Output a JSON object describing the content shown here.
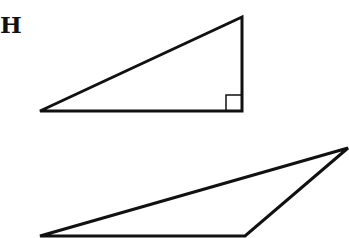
{
  "diagram": {
    "label": "H",
    "stroke_color": "#111111",
    "shapes": [
      {
        "name": "right-triangle",
        "points": "40,111 242,17 242,111",
        "right_angle_marker": "226,95 242,95 242,111 226,111"
      },
      {
        "name": "obtuse-triangle",
        "points": "40,236 348,148 245,236"
      }
    ]
  }
}
